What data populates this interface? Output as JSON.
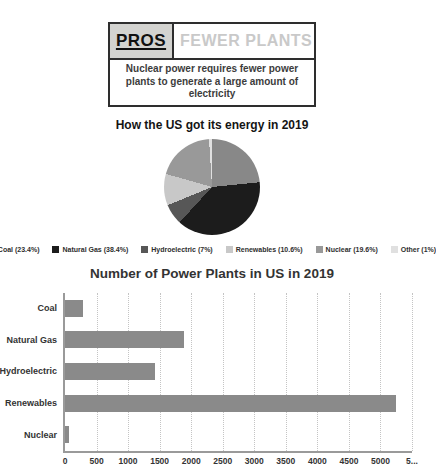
{
  "header": {
    "pros_label": "PROS",
    "title": "FEWER PLANTS",
    "description": "Nuclear power requires fewer power plants to generate a large amount of electricity"
  },
  "chart_data": [
    {
      "type": "pie",
      "title": "How the US got its energy in 2019",
      "labels": [
        "Coal",
        "Natural Gas",
        "Hydroelectric",
        "Renewables",
        "Nuclear",
        "Other"
      ],
      "values": [
        23.4,
        38.4,
        7,
        10.6,
        19.6,
        1
      ],
      "colors": [
        "#888888",
        "#1c1c1c",
        "#575757",
        "#c8c8c8",
        "#999999",
        "#e0e0e0"
      ],
      "legend_labels": [
        "Coal (23.4%)",
        "Natural Gas (38.4%)",
        "Hydroelectric (7%)",
        "Renewables (10.6%)",
        "Nuclear (19.6%)",
        "Other (1%)"
      ],
      "legend_position": "bottom"
    },
    {
      "type": "bar",
      "orientation": "horizontal",
      "title": "Number of Power Plants in US in 2019",
      "categories": [
        "Coal",
        "Natural Gas",
        "Hydroelectric",
        "Renewables",
        "Nuclear"
      ],
      "values": [
        280,
        1880,
        1430,
        5250,
        60
      ],
      "bar_color": "#8a8a8a",
      "xlim": [
        0,
        5500
      ],
      "xticks": [
        0,
        500,
        1000,
        1500,
        2000,
        2500,
        3000,
        3500,
        4000,
        4500,
        5000,
        5500
      ],
      "xtick_labels": [
        "0",
        "500",
        "1000",
        "1500",
        "2000",
        "2500",
        "3000",
        "3500",
        "4000",
        "4500",
        "5000",
        "5..."
      ],
      "grid": "vertical-dotted"
    }
  ]
}
